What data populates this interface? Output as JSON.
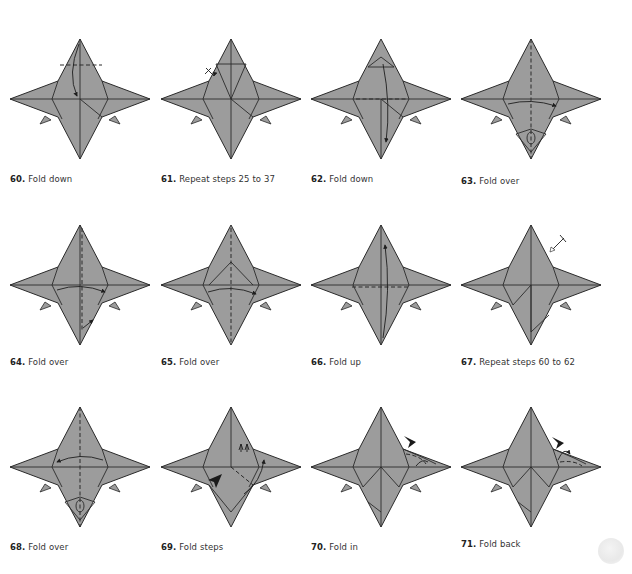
{
  "colors": {
    "paper_fill": "#9c9c9c",
    "outline": "#2a2a2a",
    "background": "#ffffff"
  },
  "steps": [
    {
      "number": "60.",
      "label": "Fold down"
    },
    {
      "number": "61.",
      "label": "Repeat steps 25 to 37"
    },
    {
      "number": "62.",
      "label": "Fold down"
    },
    {
      "number": "63.",
      "label": "Fold over"
    },
    {
      "number": "64.",
      "label": "Fold over"
    },
    {
      "number": "65.",
      "label": "Fold over"
    },
    {
      "number": "66.",
      "label": "Fold up"
    },
    {
      "number": "67.",
      "label": "Repeat steps 60 to 62"
    },
    {
      "number": "68.",
      "label": "Fold over"
    },
    {
      "number": "69.",
      "label": "Fold steps"
    },
    {
      "number": "70.",
      "label": "Fold in"
    },
    {
      "number": "71.",
      "label": "Fold back"
    }
  ],
  "icons": {
    "valley_fold": "dashed-line",
    "fold_arrow": "curved-arrow",
    "push_arrow": "black-arrowhead",
    "repeat_marker": "crossed-arrow"
  }
}
